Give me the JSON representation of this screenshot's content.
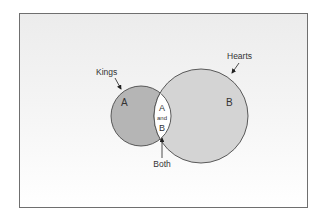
{
  "diagram": {
    "type": "venn",
    "sets": [
      {
        "id": "A",
        "label": "Kings",
        "region_letter": "A",
        "fill": "#b5b5b5",
        "stroke": "#4a4a4a"
      },
      {
        "id": "B",
        "label": "Hearts",
        "region_letter": "B",
        "fill": "#d4d4d4",
        "stroke": "#4a4a4a"
      }
    ],
    "intersection": {
      "label": "Both",
      "text_top": "A",
      "text_mid": "and",
      "text_bottom": "B",
      "fill": "#ffffff"
    },
    "colors": {
      "frame_border": "#6f6f6f",
      "text": "#333333",
      "arrow": "#222222"
    }
  }
}
